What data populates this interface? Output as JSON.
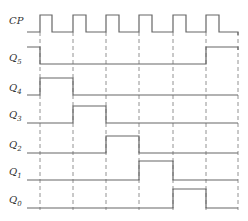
{
  "diagram": {
    "type": "timing",
    "clock": {
      "label": "CP",
      "cycles": 6
    },
    "signals": [
      {
        "name": "CP",
        "label_main": "CP",
        "label_sub": ""
      },
      {
        "name": "Q5",
        "label_main": "Q",
        "label_sub": "5",
        "levels": [
          1,
          0,
          0,
          0,
          0,
          0,
          1
        ]
      },
      {
        "name": "Q4",
        "label_main": "Q",
        "label_sub": "4",
        "levels": [
          0,
          1,
          0,
          0,
          0,
          0,
          0
        ]
      },
      {
        "name": "Q3",
        "label_main": "Q",
        "label_sub": "3",
        "levels": [
          0,
          0,
          1,
          0,
          0,
          0,
          0
        ]
      },
      {
        "name": "Q2",
        "label_main": "Q",
        "label_sub": "2",
        "levels": [
          0,
          0,
          0,
          1,
          0,
          0,
          0
        ]
      },
      {
        "name": "Q1",
        "label_main": "Q",
        "label_sub": "1",
        "levels": [
          0,
          0,
          0,
          0,
          1,
          0,
          0
        ]
      },
      {
        "name": "Q0",
        "label_main": "Q",
        "label_sub": "0",
        "levels": [
          0,
          0,
          0,
          0,
          0,
          1,
          0
        ]
      }
    ]
  }
}
